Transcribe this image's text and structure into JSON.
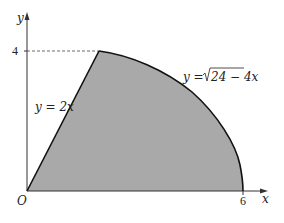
{
  "diagram": {
    "axes": {
      "x_label": "x",
      "y_label": "y",
      "origin_label": "O",
      "x_tick_label": "6",
      "y_tick_label": "4"
    },
    "curves": {
      "line_label": "y = 2x",
      "line_eq_lhs": "y = ",
      "line_eq_rhs": "2x",
      "sqrt_label_lhs": "y = ",
      "sqrt_radicand": "24 − 4x"
    },
    "colors": {
      "region_fill": "#a9a9a9",
      "curve_stroke": "#111111",
      "axis_stroke": "#333333"
    }
  }
}
